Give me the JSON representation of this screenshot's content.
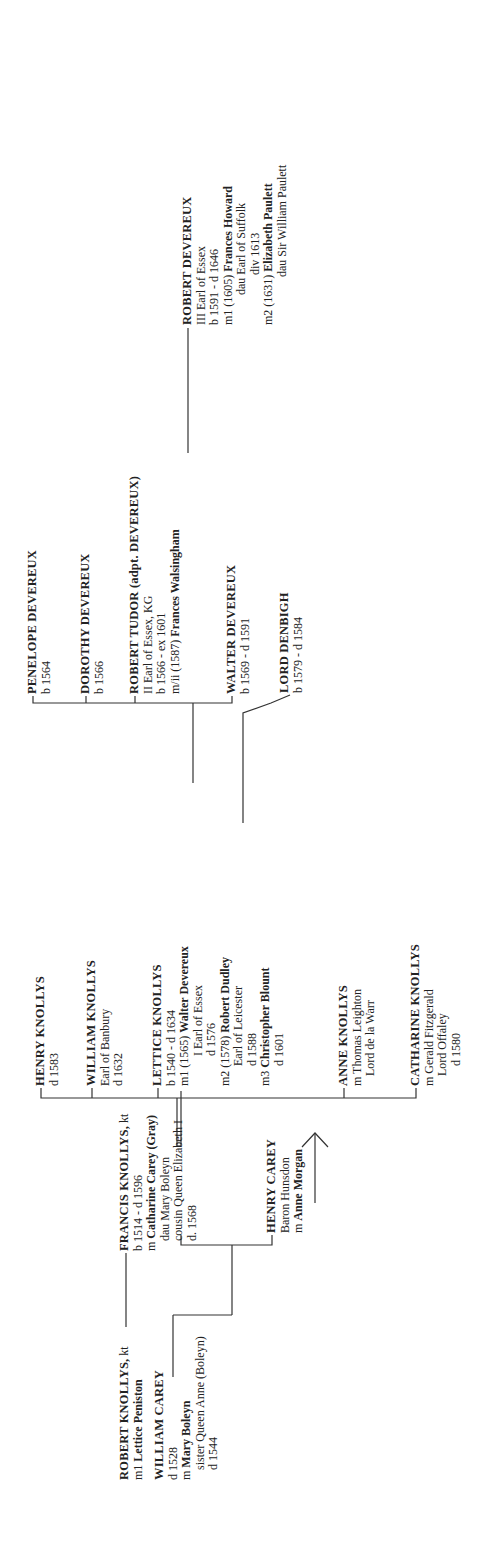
{
  "tree": {
    "robert_knollys": {
      "name": "ROBERT KNOLLYS,",
      "title": " kt",
      "m_prefix": "m1 ",
      "spouse": "Lettice Peniston"
    },
    "william_carey": {
      "name": "WILLIAM CAREY",
      "d": "d 1528",
      "m_prefix": "m ",
      "spouse": "Mary Boleyn",
      "note": "sister Queen Anne (Boleyn)",
      "spouse_d": "d 1544"
    },
    "francis_knollys": {
      "name": "FRANCIS KNOLLYS,",
      "title": " kt",
      "dates": "b 1514 - d 1596",
      "m_prefix": "m ",
      "spouse": "Catharine Carey (Gray)",
      "l1": "dau Mary Boleyn",
      "l2": "cousin Queen Elizabeth I",
      "l3": "d. 1568"
    },
    "henry_carey": {
      "name": "HENRY CAREY",
      "title": "Baron Hunsdon",
      "m_prefix": "m ",
      "spouse": "Anne Morgan"
    },
    "henry_knollys": {
      "name": "HENRY KNOLLYS",
      "d": "d 1583"
    },
    "william_knollys": {
      "name": "WILLIAM KNOLLYS",
      "title": "Earl of Banbury",
      "d": "d 1632"
    },
    "lettice_knollys": {
      "name": "LETTICE KNOLLYS",
      "dates": "b 1540 - d 1634",
      "m1_prefix": "m1 (1565) ",
      "m1": "Walter Devereux",
      "m1_title": "I Earl of Essex",
      "m1_d": "d 1576",
      "m2_prefix": "m2 (1578) ",
      "m2": "Robert Dudley",
      "m2_title": "Earl of Leicester",
      "m2_d": "d 1588",
      "m3_prefix": "m3 ",
      "m3": "Christopher Blount",
      "m3_d": "d 1601"
    },
    "anne_knollys": {
      "name": "ANNE KNOLLYS",
      "m_prefix": "m ",
      "spouse": "Thomas Leighton",
      "title": "Lord de la Warr"
    },
    "catharine_knollys": {
      "name": "CATHARINE KNOLLYS",
      "m_prefix": "m ",
      "spouse": "Gerald Fitzgerald",
      "title": "Lord Offaley",
      "d": "d 1580"
    },
    "penelope": {
      "name": "PENELOPE DEVEREUX",
      "b": "b 1564"
    },
    "dorothy": {
      "name": "DOROTHY DEVEREUX",
      "b": "b 1566"
    },
    "robert_tudor": {
      "name": "ROBERT TUDOR",
      "adpt": " (adpt. DEVEREUX)",
      "title": "II Earl of Essex, KG",
      "dates": "b 1566 - ex 1601",
      "m_prefix": "m/ii (1587) ",
      "spouse": "Frances Walsingham"
    },
    "walter_devereux": {
      "name": "WALTER DEVEREUX",
      "dates": "b 1569 - d 1591"
    },
    "lord_denbigh": {
      "name": "LORD DENBIGH",
      "dates": "b 1579 - d 1584"
    },
    "robert_devereux": {
      "name": "ROBERT DEVEREUX",
      "title": "III Earl of Essex",
      "dates": "b 1591 - d 1646",
      "m1_prefix": "m1  (1605) ",
      "m1": "Frances Howard",
      "m1_l1": "dau Earl of Suffolk",
      "m1_l2": "div 1613",
      "m2_prefix": "m2 (1631) ",
      "m2": "Elizabeth Paulett",
      "m2_l1": "dau Sir William Paulett"
    }
  }
}
